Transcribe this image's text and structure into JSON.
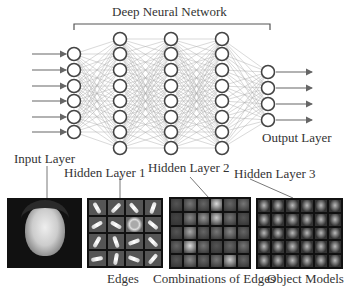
{
  "title": "Deep Neural Network",
  "layers": {
    "input": {
      "label": "Input Layer",
      "nodes": 6,
      "x": 74
    },
    "hidden1": {
      "label": "Hidden Layer 1",
      "nodes": 8,
      "x": 120
    },
    "hidden2": {
      "label": "Hidden Layer 2",
      "nodes": 8,
      "x": 171
    },
    "hidden3": {
      "label": "Hidden Layer 3",
      "nodes": 8,
      "x": 222
    },
    "output": {
      "label": "Output Layer",
      "nodes": 4,
      "x": 268
    }
  },
  "features": {
    "edges": "Edges",
    "combinations": "Combinations of Edges",
    "objects": "Object Models"
  },
  "colors": {
    "line": "#888888",
    "node": "#444444",
    "text": "#333333"
  }
}
